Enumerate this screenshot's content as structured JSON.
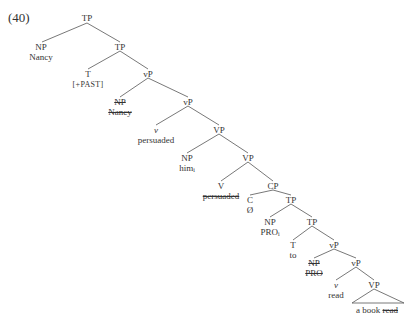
{
  "example_number": "(40)",
  "nodes": {
    "tp1": {
      "label": "TP"
    },
    "np_nancy": {
      "label": "NP",
      "word": "Nancy"
    },
    "tp2": {
      "label": "TP"
    },
    "t_past": {
      "label": "T",
      "word": "[+PAST]"
    },
    "vp_small1": {
      "label": "vP"
    },
    "np_nancy_trace": {
      "label": "NP",
      "word": "Nancy",
      "struck": true
    },
    "vp_small2": {
      "label": "vP"
    },
    "v_persuaded": {
      "label": "v",
      "word": "persuaded"
    },
    "vp1": {
      "label": "VP"
    },
    "np_him": {
      "label": "NP",
      "word": "him",
      "index": "i"
    },
    "vp2": {
      "label": "VP"
    },
    "v_persuaded_trace": {
      "label": "V",
      "word": "persuaded",
      "struck": true
    },
    "cp": {
      "label": "CP"
    },
    "c_null": {
      "label": "C",
      "word": "Ø"
    },
    "tp3": {
      "label": "TP"
    },
    "np_pro": {
      "label": "NP",
      "word": "PRO",
      "index": "i"
    },
    "tp4": {
      "label": "TP"
    },
    "t_to": {
      "label": "T",
      "word": "to"
    },
    "vp_small3": {
      "label": "vP"
    },
    "np_pro_trace": {
      "label": "NP",
      "word": "PRO",
      "struck": true
    },
    "vp_small4": {
      "label": "vP"
    },
    "v_read": {
      "label": "v",
      "word": "read"
    },
    "vp3": {
      "label": "VP"
    },
    "vp3_obj": {
      "word": "a book"
    },
    "vp3_trace": {
      "word": "read",
      "struck": true
    }
  }
}
